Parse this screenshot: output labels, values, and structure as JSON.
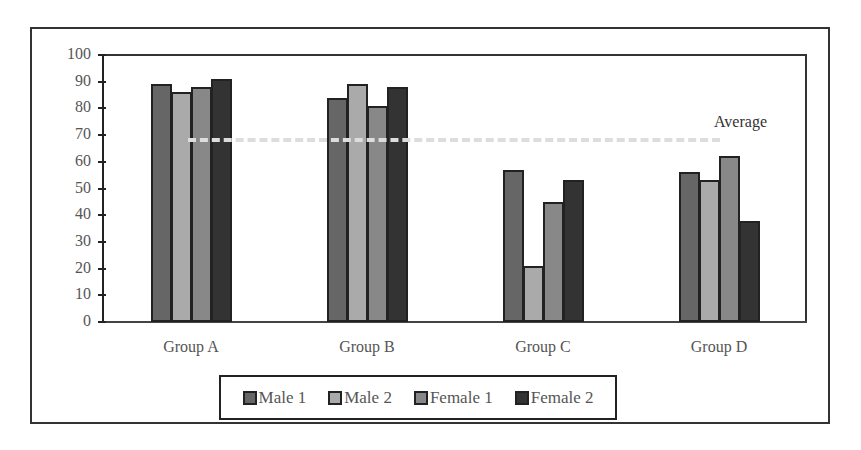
{
  "chart_data": {
    "type": "bar",
    "title": "",
    "xlabel": "",
    "ylabel": "",
    "ylim": [
      0,
      100
    ],
    "yticks": [
      0,
      10,
      20,
      30,
      40,
      50,
      60,
      70,
      80,
      90,
      100
    ],
    "grid": false,
    "legend_position": "bottom",
    "categories": [
      "Group A",
      "Group B",
      "Group C",
      "Group D"
    ],
    "series": [
      {
        "name": "Male 1",
        "color": "#666666",
        "values": [
          89,
          84,
          57,
          56
        ]
      },
      {
        "name": "Male 2",
        "color": "#aaaaaa",
        "values": [
          86,
          89,
          21,
          53
        ]
      },
      {
        "name": "Female 1",
        "color": "#888888",
        "values": [
          88,
          81,
          45,
          62
        ]
      },
      {
        "name": "Female 2",
        "color": "#333333",
        "values": [
          91,
          88,
          53,
          38
        ]
      }
    ],
    "reference_lines": [
      {
        "label": "Average",
        "value": 68,
        "style": "dashed",
        "color": "#dddddd"
      }
    ]
  }
}
